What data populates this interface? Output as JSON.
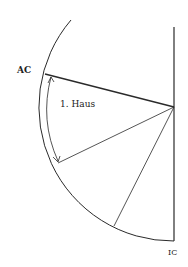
{
  "diagram": {
    "labels": {
      "ac": "AC",
      "ic": "IC",
      "house": "1. Haus"
    },
    "colors": {
      "stroke": "#2a2a2a",
      "background": "#ffffff"
    },
    "center": [
      174,
      107
    ],
    "radius": 134
  }
}
